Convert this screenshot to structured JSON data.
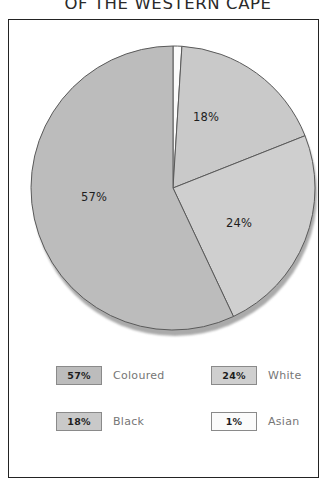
{
  "title": {
    "text": "OF THE WESTERN CAPE",
    "note_clipped_top": true
  },
  "chart_data": {
    "type": "pie",
    "title": "OF THE WESTERN CAPE",
    "categories": [
      "Asian",
      "Black",
      "White",
      "Coloured"
    ],
    "values": [
      1,
      18,
      24,
      57
    ],
    "value_labels": [
      "1%",
      "18%",
      "24%",
      "57%"
    ],
    "legend_position": "bottom",
    "start_angle_deg": 0,
    "direction": "clockwise",
    "slices": [
      {
        "label": "Asian",
        "value": 1,
        "display": "1%",
        "color": "#fbfbfb",
        "start_deg": 0,
        "end_deg": 3.6,
        "show_label_on_pie": false
      },
      {
        "label": "Black",
        "value": 18,
        "display": "18%",
        "color": "#c9c9c9",
        "start_deg": 3.6,
        "end_deg": 68.4,
        "show_label_on_pie": true,
        "label_x": 207,
        "label_y": 117
      },
      {
        "label": "White",
        "value": 24,
        "display": "24%",
        "color": "#cfcfcf",
        "start_deg": 68.4,
        "end_deg": 154.8,
        "show_label_on_pie": true,
        "label_x": 240,
        "label_y": 223
      },
      {
        "label": "Coloured",
        "value": 57,
        "display": "57%",
        "color": "#bcbcbc",
        "start_deg": 154.8,
        "end_deg": 360,
        "show_label_on_pie": true,
        "label_x": 95,
        "label_y": 197
      }
    ],
    "geometry": {
      "cx": 173,
      "cy": 188,
      "r": 142
    },
    "colors": {
      "slice_asian": "#fbfbfb",
      "slice_black": "#c9c9c9",
      "slice_white": "#cfcfcf",
      "slice_coloured": "#bcbcbc",
      "slice_outline": "#5a5a5a",
      "frame_border": "#232323",
      "legend_label_text": "#767676"
    }
  },
  "legend": {
    "rows": [
      [
        {
          "percent": "57%",
          "label": "Coloured",
          "swatch_color": "#bcbcbc"
        },
        {
          "percent": "24%",
          "label": "White",
          "swatch_color": "#cfcfcf"
        }
      ],
      [
        {
          "percent": "18%",
          "label": "Black",
          "swatch_color": "#c9c9c9"
        },
        {
          "percent": "1%",
          "label": "Asian",
          "swatch_color": "#fbfbfb"
        }
      ]
    ]
  }
}
